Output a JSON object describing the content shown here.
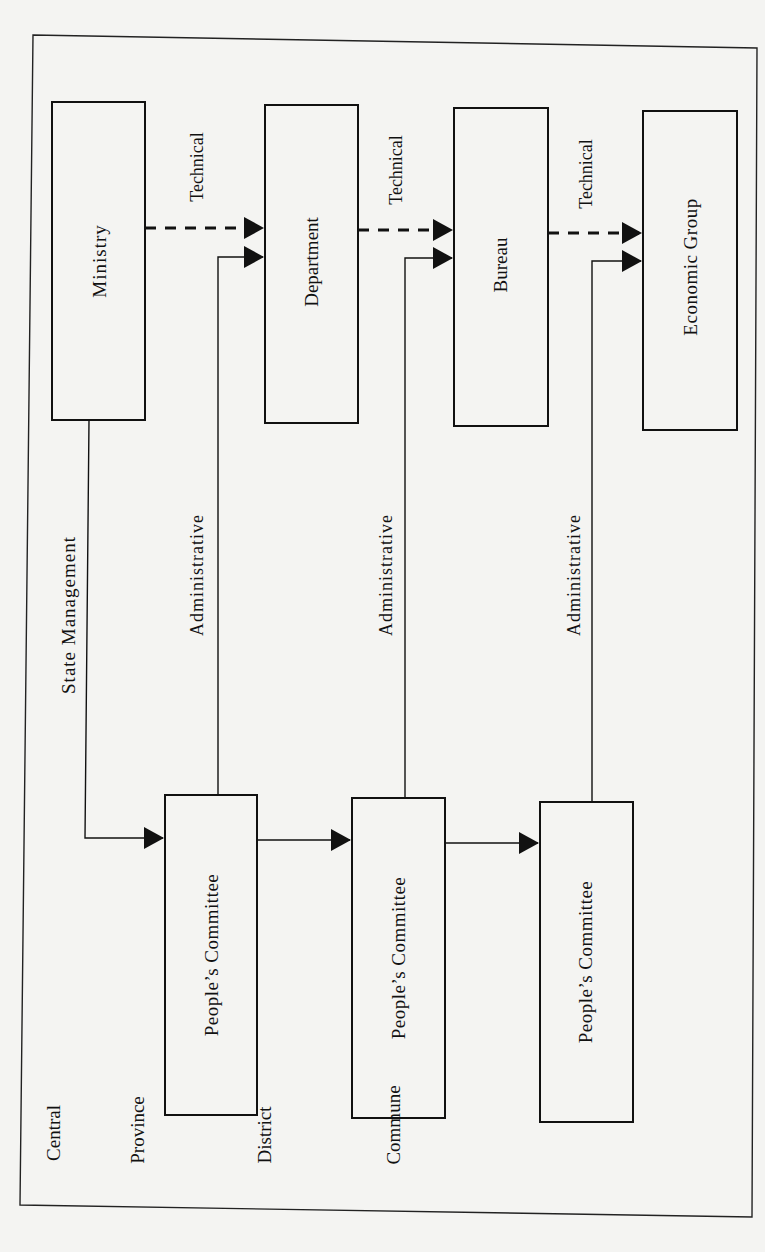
{
  "diagram": {
    "orientation": "rotated-90-ccw",
    "levels": [
      {
        "id": "central",
        "label": "Central"
      },
      {
        "id": "province",
        "label": "Province"
      },
      {
        "id": "district",
        "label": "District"
      },
      {
        "id": "commune",
        "label": "Commune"
      }
    ],
    "technical_boxes": [
      {
        "id": "ministry",
        "label": "Ministry"
      },
      {
        "id": "department",
        "label": "Department"
      },
      {
        "id": "bureau",
        "label": "Bureau"
      },
      {
        "id": "economic-group",
        "label": "Economic Group"
      }
    ],
    "committee_boxes": [
      {
        "id": "province-committee",
        "label": "People’s Committee"
      },
      {
        "id": "district-committee",
        "label": "People’s Committee"
      },
      {
        "id": "commune-committee",
        "label": "People’s Committee"
      }
    ],
    "edge_labels": {
      "state_management": "State Management",
      "technical": "Technical",
      "administrative": "Administrative"
    },
    "edges": [
      {
        "from": "ministry",
        "to": "department",
        "type": "technical",
        "style": "dashed"
      },
      {
        "from": "department",
        "to": "bureau",
        "type": "technical",
        "style": "dashed"
      },
      {
        "from": "bureau",
        "to": "economic-group",
        "type": "technical",
        "style": "dashed"
      },
      {
        "from": "ministry",
        "to": "province-committee",
        "type": "state_management",
        "style": "solid"
      },
      {
        "from": "province-committee",
        "to": "department",
        "type": "administrative",
        "style": "solid"
      },
      {
        "from": "district-committee",
        "to": "bureau",
        "type": "administrative",
        "style": "solid"
      },
      {
        "from": "commune-committee",
        "to": "economic-group",
        "type": "administrative",
        "style": "solid"
      },
      {
        "from": "province-committee",
        "to": "district-committee",
        "type": "hierarchy",
        "style": "solid"
      },
      {
        "from": "district-committee",
        "to": "commune-committee",
        "type": "hierarchy",
        "style": "solid"
      }
    ]
  }
}
